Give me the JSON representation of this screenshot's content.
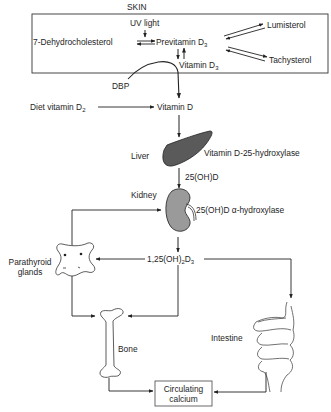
{
  "skin": {
    "label": "SKIN",
    "uv_light": "UV light",
    "dehydrocholesterol": "7-Dehydrocholesterol",
    "previtamin": "Previtamin D",
    "previtamin_sub": "3",
    "lumisterol": "Lumisterol",
    "tachysterol": "Tachysterol",
    "vitamin_d3": "Vitamin D",
    "vitamin_d3_sub": "3"
  },
  "dbp": "DBP",
  "diet": {
    "label": "Diet vitamin D",
    "sub": "2"
  },
  "vitamin_d": "Vitamin D",
  "liver": {
    "label": "Liver",
    "enzyme": "Vitamin D-25-hydroxylase"
  },
  "metabolite_25": "25(OH)D",
  "kidney": {
    "label": "Kidney",
    "enzyme": "25(OH)D α-hydroxylase"
  },
  "active_form": {
    "prefix": "1,25(OH)",
    "sub1": "2",
    "mid": "D",
    "sub2": "3"
  },
  "parathyroid": {
    "line1": "Parathyroid",
    "line2": "glands"
  },
  "bone": "Bone",
  "intestine": "Intestine",
  "calcium": {
    "line1": "Circulating",
    "line2": "calcium"
  }
}
